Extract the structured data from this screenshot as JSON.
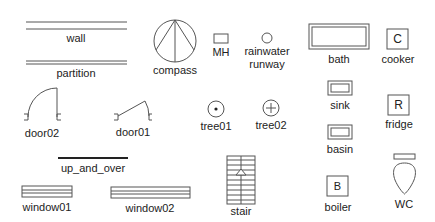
{
  "diagram": {
    "stroke_color": "#555555",
    "text_color": "#222222",
    "symbols": {
      "wall": {
        "label": "wall"
      },
      "partition": {
        "label": "partition"
      },
      "compass": {
        "label": "compass"
      },
      "manhole": {
        "label": "MH"
      },
      "rainwater_runway": {
        "label_line1": "rainwater",
        "label_line2": "runway"
      },
      "bath": {
        "label": "bath"
      },
      "cooker": {
        "label": "cooker",
        "glyph": "C"
      },
      "door02": {
        "label": "door02"
      },
      "door01": {
        "label": "door01"
      },
      "tree01": {
        "label": "tree01"
      },
      "tree02": {
        "label": "tree02"
      },
      "sink": {
        "label": "sink"
      },
      "fridge": {
        "label": "fridge",
        "glyph": "R"
      },
      "basin": {
        "label": "basin"
      },
      "up_and_over": {
        "label": "up_and_over"
      },
      "window01": {
        "label": "window01"
      },
      "window02": {
        "label": "window02"
      },
      "stair": {
        "label": "stair"
      },
      "boiler": {
        "label": "boiler",
        "glyph": "B"
      },
      "wc": {
        "label": "WC"
      }
    }
  }
}
